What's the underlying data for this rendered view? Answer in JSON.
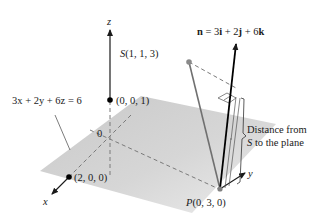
{
  "figure": {
    "plane_equation": "3x + 2y + 6z = 6",
    "normal_vector": {
      "symbol": "n",
      "label": "n = 3i + 2j + 6k",
      "parts": [
        "n",
        " = 3",
        "i",
        " + 2",
        "j",
        " + 6",
        "k"
      ]
    },
    "points": {
      "S": {
        "name": "S",
        "coords": "(1, 1, 3)"
      },
      "P": {
        "name": "P",
        "coords": "(0, 3, 0)"
      },
      "z_intercept": {
        "coords": "(0, 0, 1)"
      },
      "x_intercept": {
        "coords": "(2, 0, 0)"
      },
      "origin": {
        "label": "0"
      }
    },
    "axes": {
      "x": "x",
      "y": "y",
      "z": "z"
    },
    "annotation": {
      "line1": "Distance from",
      "line2_symbol": "S",
      "line2_rest": " to the plane"
    },
    "colors": {
      "plane": "#d3d3d3",
      "axis": "#1a1a1a",
      "segment": "#707070",
      "dashed": "#808080",
      "point_S": "#8a8a8a"
    }
  }
}
